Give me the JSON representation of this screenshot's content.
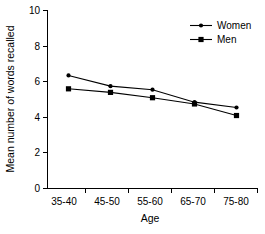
{
  "chart_data": {
    "type": "line",
    "title": "",
    "subtitle": "",
    "xlabel": "Age",
    "ylabel": "Mean number of words recalled",
    "categories": [
      "35-40",
      "45-50",
      "55-60",
      "65-70",
      "75-80"
    ],
    "ytick_labels": [
      "0",
      "2",
      "4",
      "6",
      "8",
      "10"
    ],
    "ytick_values": [
      0,
      2,
      4,
      6,
      8,
      10
    ],
    "ylim": [
      0,
      10
    ],
    "grid": false,
    "legend_position": "top-right",
    "series": [
      {
        "name": "Women",
        "marker": "circle",
        "color": "#000000",
        "values": [
          6.35,
          5.75,
          5.55,
          4.85,
          4.55
        ]
      },
      {
        "name": "Men",
        "marker": "square",
        "color": "#000000",
        "values": [
          5.6,
          5.4,
          5.1,
          4.75,
          4.1
        ]
      }
    ]
  },
  "legend": {
    "entries": [
      {
        "label": "Women"
      },
      {
        "label": "Men"
      }
    ]
  },
  "axes": {
    "x_title": "Age",
    "y_title": "Mean number of words recalled"
  },
  "colors": {
    "ink": "#000000",
    "background": "#ffffff"
  }
}
